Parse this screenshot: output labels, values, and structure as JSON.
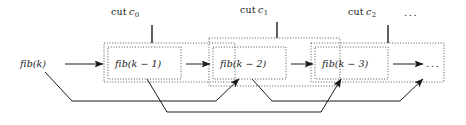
{
  "figure": {
    "width": 466,
    "height": 125,
    "background": "#ffffff",
    "ink_color": "#1a1a1a"
  },
  "cuts": [
    {
      "id": "c0",
      "word": "cut",
      "var": "c",
      "sub": "0",
      "full_label": "cut c0",
      "tick_x": 152,
      "box": {
        "x": 104,
        "y": 43,
        "w": 131,
        "h": 39
      }
    },
    {
      "id": "c1",
      "word": "cut",
      "var": "c",
      "sub": "1",
      "full_label": "cut c1",
      "tick_x": 277,
      "box": {
        "x": 209,
        "y": 38,
        "w": 131,
        "h": 48
      }
    },
    {
      "id": "c2",
      "word": "cut",
      "var": "c",
      "sub": "2",
      "full_label": "cut c2",
      "tick_x": 388,
      "box": {
        "x": 311,
        "y": 43,
        "w": 133,
        "h": 39
      }
    }
  ],
  "trailing_ellipsis": "...",
  "nodes": [
    {
      "id": "n0",
      "label": "fib(k)",
      "boxed": false,
      "cx": 43,
      "cy": 64
    },
    {
      "id": "n1",
      "label": "fib(k − 1)",
      "boxed": true,
      "box": {
        "x": 108,
        "y": 47,
        "w": 73,
        "h": 32
      },
      "cx": 144,
      "cy": 64
    },
    {
      "id": "n2",
      "label": "fib(k − 2)",
      "boxed": true,
      "box": {
        "x": 213,
        "y": 47,
        "w": 73,
        "h": 32
      },
      "cx": 249,
      "cy": 64
    },
    {
      "id": "n3",
      "label": "fib(k − 3)",
      "boxed": true,
      "box": {
        "x": 315,
        "y": 47,
        "w": 73,
        "h": 32
      },
      "cx": 351,
      "cy": 64
    },
    {
      "id": "n4",
      "label": "...",
      "boxed": false,
      "cx": 432,
      "cy": 66
    }
  ],
  "forward_arrows": [
    {
      "from": "n0",
      "to": "n1",
      "x1": 65,
      "x2": 103,
      "y": 64
    },
    {
      "from": "n1",
      "to": "n2",
      "x1": 186,
      "x2": 209,
      "y": 64
    },
    {
      "from": "n2",
      "to": "n3",
      "x1": 291,
      "x2": 312,
      "y": 64
    },
    {
      "from": "n3",
      "to": "n4",
      "x1": 393,
      "x2": 423,
      "y": 64
    }
  ],
  "feedback_arrows": [
    {
      "from": "n0",
      "to": "n2",
      "label": "fib(k) to fib(k-2)"
    },
    {
      "from": "n1",
      "to": "n3",
      "label": "fib(k-1) to fib(k-3)"
    },
    {
      "from": "n2",
      "to": "n4",
      "label": "fib(k-2) to next"
    }
  ]
}
